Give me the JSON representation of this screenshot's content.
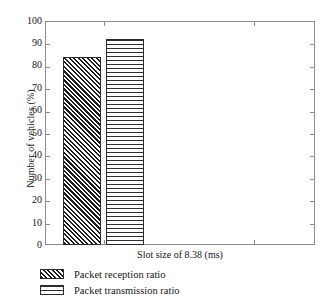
{
  "chart_data": {
    "type": "bar",
    "title": "",
    "xlabel": "Slot size of 8.38 (ms)",
    "ylabel": "Number of vehicles (%)",
    "categories": [
      "Slot size of 8.38 (ms)"
    ],
    "series": [
      {
        "name": "Packet reception ratio",
        "values": [
          84
        ],
        "pattern": "diagonal-hatch",
        "color": "#1c1c1c"
      },
      {
        "name": "Packet transmission ratio",
        "values": [
          92
        ],
        "pattern": "horizontal-hatch",
        "color": "#2e2e2e"
      }
    ],
    "ylim": [
      0,
      100
    ],
    "yticks": [
      0,
      10,
      20,
      30,
      40,
      50,
      60,
      70,
      80,
      90,
      100
    ],
    "ytick_labels": [
      "0",
      "10",
      "20",
      "30",
      "40",
      "50",
      "60",
      "70",
      "80",
      "90",
      "100"
    ],
    "grid": false,
    "legend_position": "below-axes",
    "frame": "box-with-inward-ticks"
  },
  "axes": {
    "y_title": "Number of vehicles (%)",
    "x_title": "Slot size of 8.38 (ms)",
    "y_labels": [
      "100",
      "90",
      "80",
      "70",
      "60",
      "50",
      "40",
      "30",
      "20",
      "10",
      "0"
    ]
  },
  "legend": {
    "items": [
      {
        "label": "Packet reception ratio"
      },
      {
        "label": "Packet transmission ratio"
      }
    ]
  },
  "colors": {
    "frame": "#8c8c8c",
    "bar_border": "#2a2a2a",
    "text": "#161616",
    "background": "#ffffff"
  }
}
